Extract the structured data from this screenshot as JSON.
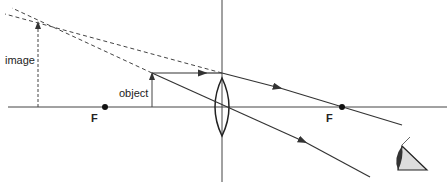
{
  "diagram": {
    "labels": {
      "image": "image",
      "object": "object",
      "focal_left": "F",
      "focal_right": "F"
    },
    "colors": {
      "line": "#333333",
      "dashed": "#444444",
      "background": "#ffffff"
    },
    "icons": [
      "eye-icon",
      "lens-icon"
    ]
  }
}
